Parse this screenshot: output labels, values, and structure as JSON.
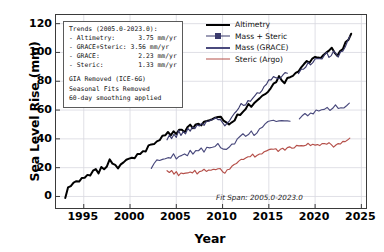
{
  "chart_data": {
    "type": "line",
    "title": "",
    "xlabel": "Year",
    "ylabel": "Sea Level Rise (mm)",
    "xlim": [
      1992.0,
      2025.5
    ],
    "ylim": [
      -8,
      126
    ],
    "xticks": [
      1995,
      2000,
      2005,
      2010,
      2015,
      2020,
      2025
    ],
    "yticks": [
      0,
      20,
      40,
      60,
      80,
      100,
      120
    ],
    "grid": true,
    "legend_position": "top-right",
    "annotation": "Fit Span: 2005.0-2023.0",
    "series": [
      {
        "name": "Altimetry",
        "color": "#000000",
        "x": [
          1993.0,
          1993.3,
          1993.6,
          1993.9,
          1994.2,
          1994.5,
          1994.8,
          1995.1,
          1995.4,
          1995.7,
          1996.0,
          1996.3,
          1996.6,
          1996.9,
          1997.2,
          1997.5,
          1997.8,
          1998.1,
          1998.4,
          1998.7,
          1999.0,
          1999.3,
          1999.6,
          1999.9,
          2000.2,
          2000.5,
          2000.8,
          2001.1,
          2001.4,
          2001.7,
          2002.0,
          2002.3,
          2002.6,
          2002.9,
          2003.2,
          2003.5,
          2003.8,
          2004.1,
          2004.4,
          2004.7,
          2005.0,
          2005.3,
          2005.6,
          2005.9,
          2006.2,
          2006.5,
          2006.8,
          2007.1,
          2007.4,
          2007.7,
          2008.0,
          2008.3,
          2008.6,
          2008.9,
          2009.2,
          2009.5,
          2009.8,
          2010.1,
          2010.4,
          2010.7,
          2011.0,
          2011.3,
          2011.6,
          2011.9,
          2012.2,
          2012.5,
          2012.8,
          2013.1,
          2013.4,
          2013.7,
          2014.0,
          2014.3,
          2014.6,
          2014.9,
          2015.2,
          2015.5,
          2015.8,
          2016.1,
          2016.4,
          2016.7,
          2017.0,
          2017.3,
          2017.6,
          2017.9,
          2018.2,
          2018.5,
          2018.8,
          2019.1,
          2019.4,
          2019.7,
          2020.0,
          2020.3,
          2020.6,
          2020.9,
          2021.2,
          2021.5,
          2021.8,
          2022.1,
          2022.4,
          2022.7,
          2023.0,
          2023.3,
          2023.6,
          2023.9
        ],
        "y": [
          0.5,
          5.0,
          8.5,
          9.5,
          11.0,
          10.5,
          12.5,
          14.0,
          15.5,
          14.5,
          16.5,
          18.0,
          17.0,
          19.0,
          18.0,
          21.0,
          24.5,
          23.0,
          21.5,
          20.0,
          21.5,
          23.5,
          25.0,
          26.5,
          28.0,
          27.0,
          29.5,
          31.0,
          32.5,
          31.5,
          34.0,
          35.5,
          37.0,
          38.5,
          40.0,
          42.0,
          41.0,
          43.5,
          42.5,
          44.5,
          43.0,
          45.0,
          46.5,
          45.5,
          47.5,
          49.0,
          48.0,
          50.0,
          51.5,
          50.5,
          52.5,
          53.5,
          52.0,
          53.5,
          55.0,
          54.0,
          55.5,
          53.5,
          52.0,
          51.0,
          52.5,
          54.0,
          56.0,
          58.0,
          60.0,
          62.0,
          64.0,
          63.0,
          65.0,
          67.0,
          68.5,
          70.0,
          72.0,
          74.0,
          76.0,
          78.0,
          80.5,
          83.0,
          81.5,
          80.0,
          81.5,
          83.0,
          85.0,
          86.5,
          88.0,
          90.0,
          92.0,
          94.5,
          93.0,
          94.5,
          96.0,
          97.5,
          96.0,
          97.5,
          99.0,
          100.5,
          102.0,
          101.0,
          99.0,
          101.0,
          103.0,
          106.0,
          110.0,
          114.0
        ]
      },
      {
        "name": "Mass + Steric",
        "color": "#3b3b6d",
        "x": [
          2004.0,
          2004.25,
          2004.5,
          2004.75,
          2005.0,
          2005.25,
          2005.5,
          2005.75,
          2006.0,
          2006.25,
          2006.5,
          2006.75,
          2007.0,
          2007.25,
          2007.5,
          2007.75,
          2008.0,
          2008.25,
          2008.5,
          2008.75,
          2009.0,
          2009.25,
          2009.5,
          2009.75,
          2010.0,
          2010.25,
          2010.5,
          2010.75,
          2011.0,
          2011.25,
          2011.5,
          2011.75,
          2012.0,
          2012.25,
          2012.5,
          2012.75,
          2013.0,
          2013.25,
          2013.5,
          2013.75,
          2014.0,
          2014.25,
          2014.5,
          2014.75,
          2015.0,
          2015.25,
          2015.5,
          2015.75,
          2016.0,
          2016.25,
          2016.5,
          2016.75,
          2017.0,
          2018.2,
          2018.5,
          2018.75,
          2019.0,
          2019.25,
          2019.5,
          2019.75,
          2020.0,
          2020.25,
          2020.5,
          2020.75,
          2021.0,
          2021.25,
          2021.5,
          2021.75,
          2022.0,
          2022.25,
          2022.5,
          2022.75,
          2023.0,
          2023.25,
          2023.5,
          2023.75
        ],
        "y": [
          40.0,
          43.0,
          41.0,
          44.0,
          42.0,
          45.0,
          43.5,
          46.0,
          44.5,
          47.0,
          46.0,
          48.5,
          47.5,
          50.0,
          49.0,
          51.5,
          50.5,
          53.0,
          52.0,
          54.0,
          53.0,
          55.5,
          54.5,
          53.0,
          51.5,
          50.0,
          51.5,
          53.5,
          55.5,
          57.5,
          59.5,
          61.5,
          63.5,
          62.5,
          64.5,
          66.5,
          65.5,
          67.5,
          69.5,
          71.0,
          72.5,
          74.5,
          76.5,
          78.5,
          80.0,
          82.0,
          84.0,
          82.5,
          81.0,
          82.5,
          84.0,
          85.5,
          84.5,
          86.0,
          88.0,
          89.5,
          91.0,
          93.0,
          91.5,
          93.0,
          94.5,
          96.0,
          94.5,
          96.0,
          97.5,
          99.0,
          97.5,
          99.0,
          100.5,
          99.5,
          97.5,
          99.5,
          101.5,
          104.0,
          107.0,
          110.5
        ]
      },
      {
        "name": "Mass (GRACE)",
        "color": "#4a4a7d",
        "x": [
          2002.3,
          2002.6,
          2002.9,
          2003.2,
          2003.5,
          2003.8,
          2004.1,
          2004.4,
          2004.7,
          2005.0,
          2005.3,
          2005.6,
          2005.9,
          2006.2,
          2006.5,
          2006.8,
          2007.1,
          2007.4,
          2007.7,
          2008.0,
          2008.3,
          2008.6,
          2008.9,
          2009.2,
          2009.5,
          2009.8,
          2010.1,
          2010.4,
          2010.7,
          2011.0,
          2011.3,
          2011.6,
          2011.9,
          2012.2,
          2012.5,
          2012.8,
          2013.1,
          2013.4,
          2013.7,
          2014.0,
          2014.3,
          2014.6,
          2014.9,
          2015.2,
          2015.5,
          2015.8,
          2016.1,
          2016.4,
          2016.7,
          2017.0,
          2017.3,
          2018.3,
          2018.6,
          2018.9,
          2019.2,
          2019.5,
          2019.8,
          2020.1,
          2020.4,
          2020.7,
          2021.0,
          2021.3,
          2021.6,
          2021.9,
          2022.2,
          2022.5,
          2022.8,
          2023.1,
          2023.4,
          2023.7
        ],
        "y": [
          19.5,
          23.0,
          25.5,
          24.0,
          26.0,
          25.0,
          27.5,
          26.0,
          28.5,
          27.0,
          29.0,
          28.0,
          30.0,
          29.0,
          31.0,
          30.0,
          32.0,
          31.0,
          33.0,
          32.0,
          34.0,
          33.0,
          35.0,
          34.0,
          36.0,
          34.5,
          33.0,
          32.0,
          33.5,
          35.5,
          37.5,
          39.5,
          41.0,
          42.5,
          41.5,
          43.0,
          44.5,
          43.5,
          45.0,
          46.5,
          48.0,
          49.5,
          51.0,
          52.5,
          53.5,
          52.5,
          51.5,
          52.5,
          53.5,
          52.5,
          53.0,
          54.0,
          55.5,
          57.0,
          56.0,
          57.5,
          58.5,
          59.5,
          58.5,
          59.5,
          60.5,
          61.5,
          60.5,
          61.5,
          62.5,
          61.5,
          60.5,
          61.5,
          62.5,
          64.0
        ]
      },
      {
        "name": "Steric (Argo)",
        "color": "#b5504a",
        "x": [
          2004.0,
          2004.25,
          2004.5,
          2004.75,
          2005.0,
          2005.25,
          2005.5,
          2005.75,
          2006.0,
          2006.25,
          2006.5,
          2006.75,
          2007.0,
          2007.25,
          2007.5,
          2007.75,
          2008.0,
          2008.25,
          2008.5,
          2008.75,
          2009.0,
          2009.25,
          2009.5,
          2009.75,
          2010.0,
          2010.25,
          2010.5,
          2010.75,
          2011.0,
          2011.25,
          2011.5,
          2011.75,
          2012.0,
          2012.25,
          2012.5,
          2012.75,
          2013.0,
          2013.25,
          2013.5,
          2013.75,
          2014.0,
          2014.25,
          2014.5,
          2014.75,
          2015.0,
          2015.25,
          2015.5,
          2015.75,
          2016.0,
          2016.25,
          2016.5,
          2016.75,
          2017.0,
          2017.25,
          2017.5,
          2017.75,
          2018.0,
          2018.25,
          2018.5,
          2018.75,
          2019.0,
          2019.25,
          2019.5,
          2019.75,
          2020.0,
          2020.25,
          2020.5,
          2020.75,
          2021.0,
          2021.25,
          2021.5,
          2021.75,
          2022.0,
          2022.25,
          2022.5,
          2022.75,
          2023.0,
          2023.25,
          2023.5,
          2023.75
        ],
        "y": [
          17.5,
          16.0,
          17.5,
          15.5,
          17.0,
          15.0,
          16.5,
          15.0,
          16.5,
          15.5,
          17.0,
          16.0,
          17.5,
          16.5,
          18.0,
          17.0,
          18.5,
          17.5,
          19.0,
          18.0,
          19.5,
          18.5,
          20.0,
          18.5,
          17.0,
          16.5,
          18.0,
          19.5,
          21.0,
          22.0,
          23.5,
          24.5,
          26.0,
          25.0,
          26.5,
          28.0,
          27.0,
          28.5,
          27.5,
          29.0,
          30.0,
          29.0,
          30.5,
          31.5,
          33.0,
          32.0,
          33.5,
          32.5,
          31.5,
          32.5,
          33.5,
          32.5,
          33.5,
          34.5,
          33.5,
          34.5,
          35.5,
          34.5,
          35.5,
          34.5,
          35.5,
          36.5,
          35.5,
          36.5,
          35.5,
          36.5,
          35.5,
          36.5,
          37.0,
          36.0,
          37.0,
          36.0,
          35.0,
          36.0,
          37.0,
          36.0,
          37.5,
          38.0,
          39.0,
          40.0
        ]
      }
    ]
  },
  "infobox": {
    "lines": [
      "Trends (2005.0-2023.0):",
      "- Altimetry:      3.75 mm/yr",
      "- GRACE+Steric: 3.56 mm/yr",
      "- GRACE:          2.23 mm/yr",
      "- Steric:         1.33 mm/yr"
    ],
    "notes": [
      "GIA Removed (ICE-6G)",
      "Seasonal Fits Removed",
      "60-day smoothing applied"
    ]
  },
  "legend": {
    "items": [
      {
        "label": "Altimetry",
        "color": "#000000",
        "width": 2.6,
        "marker": false
      },
      {
        "label": "Mass + Steric",
        "color": "#3b3b6d",
        "width": 1.7,
        "marker": true
      },
      {
        "label": "Mass (GRACE)",
        "color": "#4a4a7d",
        "width": 2.2,
        "marker": false
      },
      {
        "label": "Steric (Argo)",
        "color": "#b5504a",
        "width": 1.7,
        "marker": false
      }
    ]
  }
}
